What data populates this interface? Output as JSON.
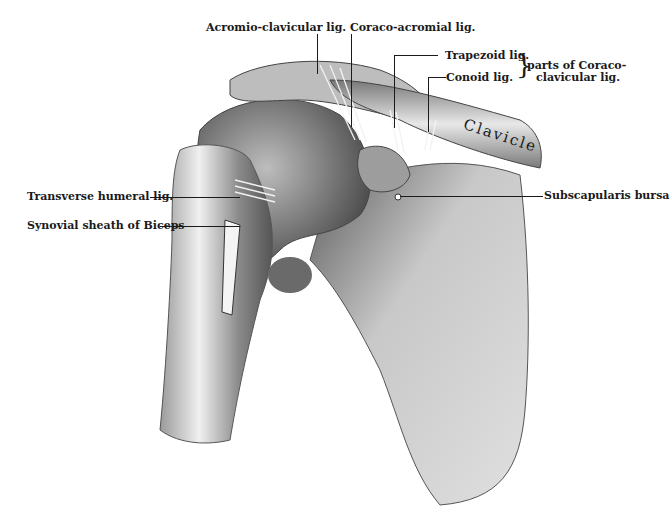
{
  "figure": {
    "colors": {
      "bone_light": "#e8e8e8",
      "bone_mid": "#a8a8a8",
      "bone_dark": "#4a4a4a",
      "ink": "#1a1a1a",
      "background": "#ffffff"
    },
    "labels": {
      "acromio_clavicular": "Acromio-clavicular lig.",
      "coraco_acromial": "Coraco-acromial lig.",
      "trapezoid": "Trapezoid  lig.",
      "conoid": "Conoid lig.",
      "coraco_clavicular_line1": "parts of Coraco-",
      "coraco_clavicular_line2": "clavicular lig.",
      "brace": "}",
      "transverse_humeral": "Transverse humeral lig.",
      "synovial_sheath": "Synovial sheath of Biceps",
      "subscapularis_bursa": "Subscapularis bursa",
      "clavicle": "Clavicle"
    }
  }
}
